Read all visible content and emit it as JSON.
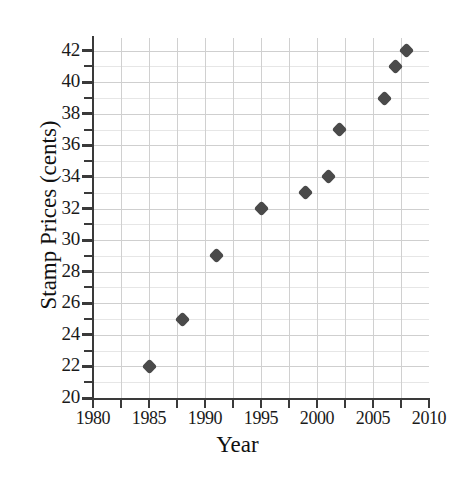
{
  "chart_data": {
    "type": "scatter",
    "title": "",
    "xlabel": "Year",
    "ylabel": "Stamp Prices (cents)",
    "xlim": [
      1980,
      2010
    ],
    "ylim": [
      20,
      42.8
    ],
    "grid": true,
    "legend": null,
    "x_tick_labels": [
      "1980",
      "1985",
      "1990",
      "1995",
      "2000",
      "2005",
      "2010"
    ],
    "x_tick_values": [
      1980,
      1985,
      1990,
      1995,
      2000,
      2005,
      2010
    ],
    "x_minor_tick_values": [
      1982.5,
      1987.5,
      1992.5,
      1997.5,
      2002.5,
      2007.5
    ],
    "y_tick_labels": [
      "20",
      "22",
      "24",
      "26",
      "28",
      "30",
      "32",
      "34",
      "36",
      "38",
      "40",
      "42"
    ],
    "y_tick_values": [
      20,
      22,
      24,
      26,
      28,
      30,
      32,
      34,
      36,
      38,
      40,
      42
    ],
    "y_minor_tick_values": [
      21,
      23,
      25,
      27,
      29,
      31,
      33,
      35,
      37,
      39,
      41
    ],
    "series": [
      {
        "name": "Stamp Prices",
        "marker": "diamond",
        "color": "#4a4a4a",
        "points": [
          {
            "x": 1985,
            "y": 22
          },
          {
            "x": 1988,
            "y": 25
          },
          {
            "x": 1991,
            "y": 29
          },
          {
            "x": 1995,
            "y": 32
          },
          {
            "x": 1999,
            "y": 33
          },
          {
            "x": 2001,
            "y": 34
          },
          {
            "x": 2002,
            "y": 37
          },
          {
            "x": 2006,
            "y": 39
          },
          {
            "x": 2007,
            "y": 41
          },
          {
            "x": 2008,
            "y": 42
          }
        ]
      }
    ]
  },
  "colors": {
    "marker": "#4a4a4a",
    "axis": "#3a3a3a",
    "grid": "#d8d8d8",
    "text": "#111111",
    "background": "#ffffff"
  }
}
